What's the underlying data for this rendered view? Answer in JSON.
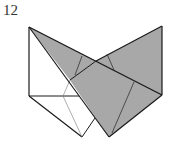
{
  "step": {
    "number": "12"
  },
  "diagram": {
    "type": "origami-fold-step",
    "colors": {
      "paper_front": "#ffffff",
      "paper_back": "#a8a8a8",
      "edge": "#1a1a1a",
      "crease": "#555555"
    }
  }
}
